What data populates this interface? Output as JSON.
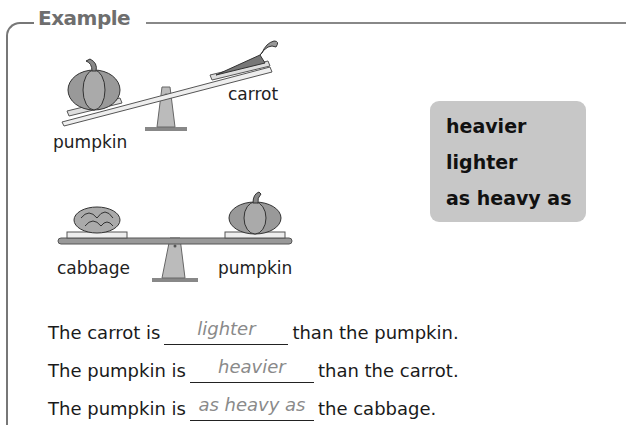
{
  "section": {
    "title": "Example"
  },
  "scale1": {
    "left_label": "pumpkin",
    "right_label": "carrot"
  },
  "scale2": {
    "left_label": "cabbage",
    "right_label": "pumpkin"
  },
  "word_bank": {
    "words": [
      "heavier",
      "lighter",
      "as heavy as"
    ]
  },
  "sentences": [
    {
      "before": "The carrot is",
      "answer": "lighter",
      "after": "than the pumpkin."
    },
    {
      "before": "The pumpkin is",
      "answer": "heavier",
      "after": "than the carrot."
    },
    {
      "before": "The pumpkin is",
      "answer": "as heavy as",
      "after": "the cabbage."
    }
  ],
  "colors": {
    "frame": "#777777",
    "word_bank_bg": "#c7c7c7",
    "answer_text": "#8a8a8a"
  }
}
